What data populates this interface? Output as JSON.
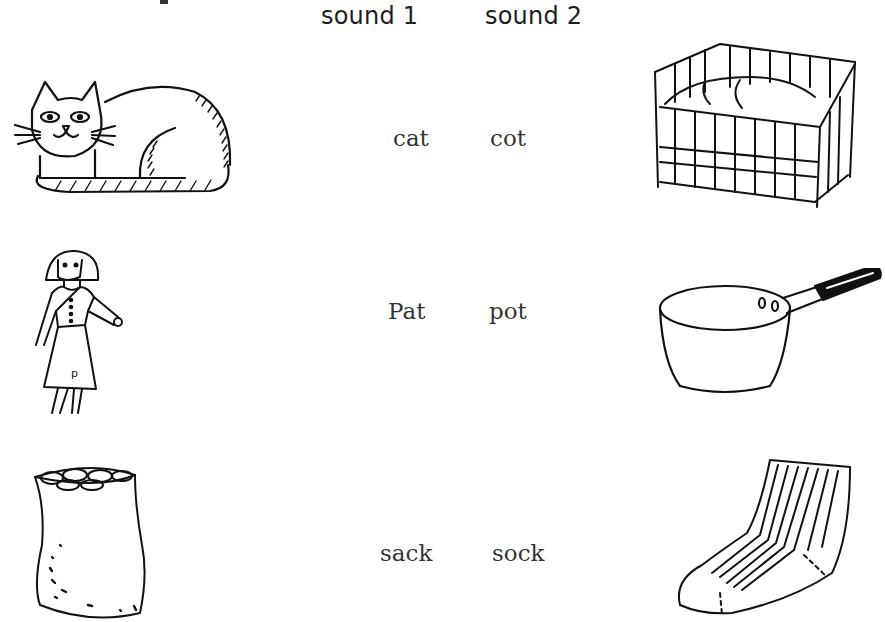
{
  "columns": {
    "sound1_label": "sound 1",
    "sound2_label": "sound 2"
  },
  "rows": [
    {
      "left_picture": "cat-illustration",
      "sound1_word": "cat",
      "sound2_word": "cot",
      "right_picture": "cot-illustration"
    },
    {
      "left_picture": "girl-pat-illustration",
      "sound1_word": "Pat",
      "sound2_word": "pot",
      "right_picture": "saucepan-illustration"
    },
    {
      "left_picture": "sack-illustration",
      "sound1_word": "sack",
      "sound2_word": "sock",
      "right_picture": "sock-illustration"
    }
  ]
}
